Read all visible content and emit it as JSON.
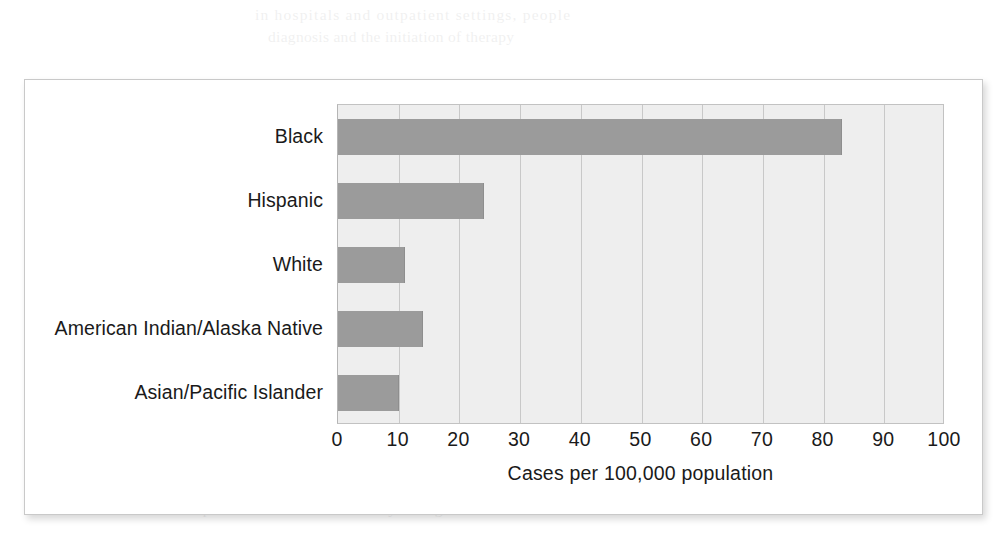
{
  "page": {
    "background_color": "#ffffff",
    "bleed_through_text": [
      "in hospitals and outpatient settings, people",
      "diagnosis and the initiation of therapy",
      "for the disease among certain populations",
      "reported cases declined steadily during the"
    ]
  },
  "figure": {
    "panel_border_color": "#c9c9c9",
    "panel_background": "#ffffff",
    "plot_background": "#eeeeee",
    "gridline_color": "#c8c8c8",
    "bar_color": "#9b9b9b",
    "text_color": "#1a1a1a"
  },
  "chart_data": {
    "type": "bar",
    "orientation": "horizontal",
    "title": "",
    "subtitle": "",
    "xlabel": "Cases per 100,000 population",
    "ylabel": "",
    "xlim": [
      0,
      100
    ],
    "xticks": [
      0,
      10,
      20,
      30,
      40,
      50,
      60,
      70,
      80,
      90,
      100
    ],
    "xtick_labels": [
      "0",
      "10",
      "20",
      "30",
      "40",
      "50",
      "60",
      "70",
      "80",
      "90",
      "100"
    ],
    "grid": "vertical",
    "legend": "none",
    "categories": [
      "Black",
      "Hispanic",
      "White",
      "American Indian/Alaska Native",
      "Asian/Pacific Islander"
    ],
    "values": [
      83,
      24,
      11,
      14,
      10
    ],
    "series": [
      {
        "name": "Cases per 100,000 population",
        "values": [
          83,
          24,
          11,
          14,
          10
        ]
      }
    ]
  }
}
